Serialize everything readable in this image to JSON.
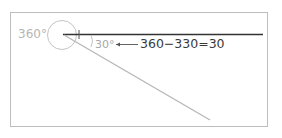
{
  "diagram": {
    "labels": {
      "full_angle": "360°",
      "result_angle": "30°",
      "equation": "360−330=30"
    },
    "colors": {
      "frame_border": "#bdbdbd",
      "baseline": "#333333",
      "diagonal": "#b8b8b8",
      "circle": "#c4c4c4",
      "arrow": "#555555",
      "equation_text": "#3a3a3a",
      "muted_text": "#b5b5b5"
    }
  }
}
